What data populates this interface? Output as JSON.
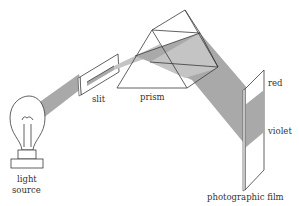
{
  "diagram": {
    "title": "",
    "labels": {
      "light_source_line1": "light",
      "light_source_line2": "source",
      "slit": "slit",
      "prism": "prism",
      "red": "red",
      "violet": "violet",
      "film": "photographic film"
    },
    "components": [
      "light-bulb",
      "slit",
      "prism",
      "photographic-film"
    ],
    "colors": {
      "beam": "#a9a9a9",
      "beam_light": "#c4c4c4",
      "line": "#3a3a3a",
      "background": "#ffffff",
      "text": "#333333"
    }
  }
}
